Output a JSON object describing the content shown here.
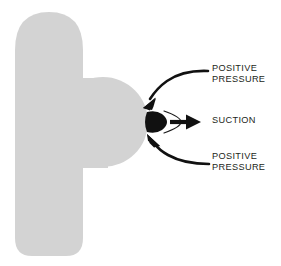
{
  "diagram": {
    "background_color": "#ffffff",
    "body_fill_color": "#d3d3d3",
    "ink_color": "#1a1a1a",
    "text_color": "#231f20",
    "shapes": {
      "body_name": "gray-body-profile",
      "nozzle_name": "black-tip-blob",
      "arc_name": "flow-separation-arc"
    },
    "labels": {
      "positive_pressure_top": {
        "line1": "POSITIVE",
        "line2": "PRESSURE"
      },
      "suction": {
        "line1": "SUCTION"
      },
      "positive_pressure_bottom": {
        "line1": "POSITIVE",
        "line2": "PRESSURE"
      }
    },
    "arrows": [
      {
        "name": "arrow-positive-pressure-top",
        "direction": "curved-down-left",
        "points_to": "upper surface of body tip"
      },
      {
        "name": "arrow-suction",
        "direction": "straight-right",
        "points_to": "away from body tip"
      },
      {
        "name": "arrow-positive-pressure-bottom",
        "direction": "curved-up-left",
        "points_to": "lower surface of body tip"
      }
    ]
  }
}
